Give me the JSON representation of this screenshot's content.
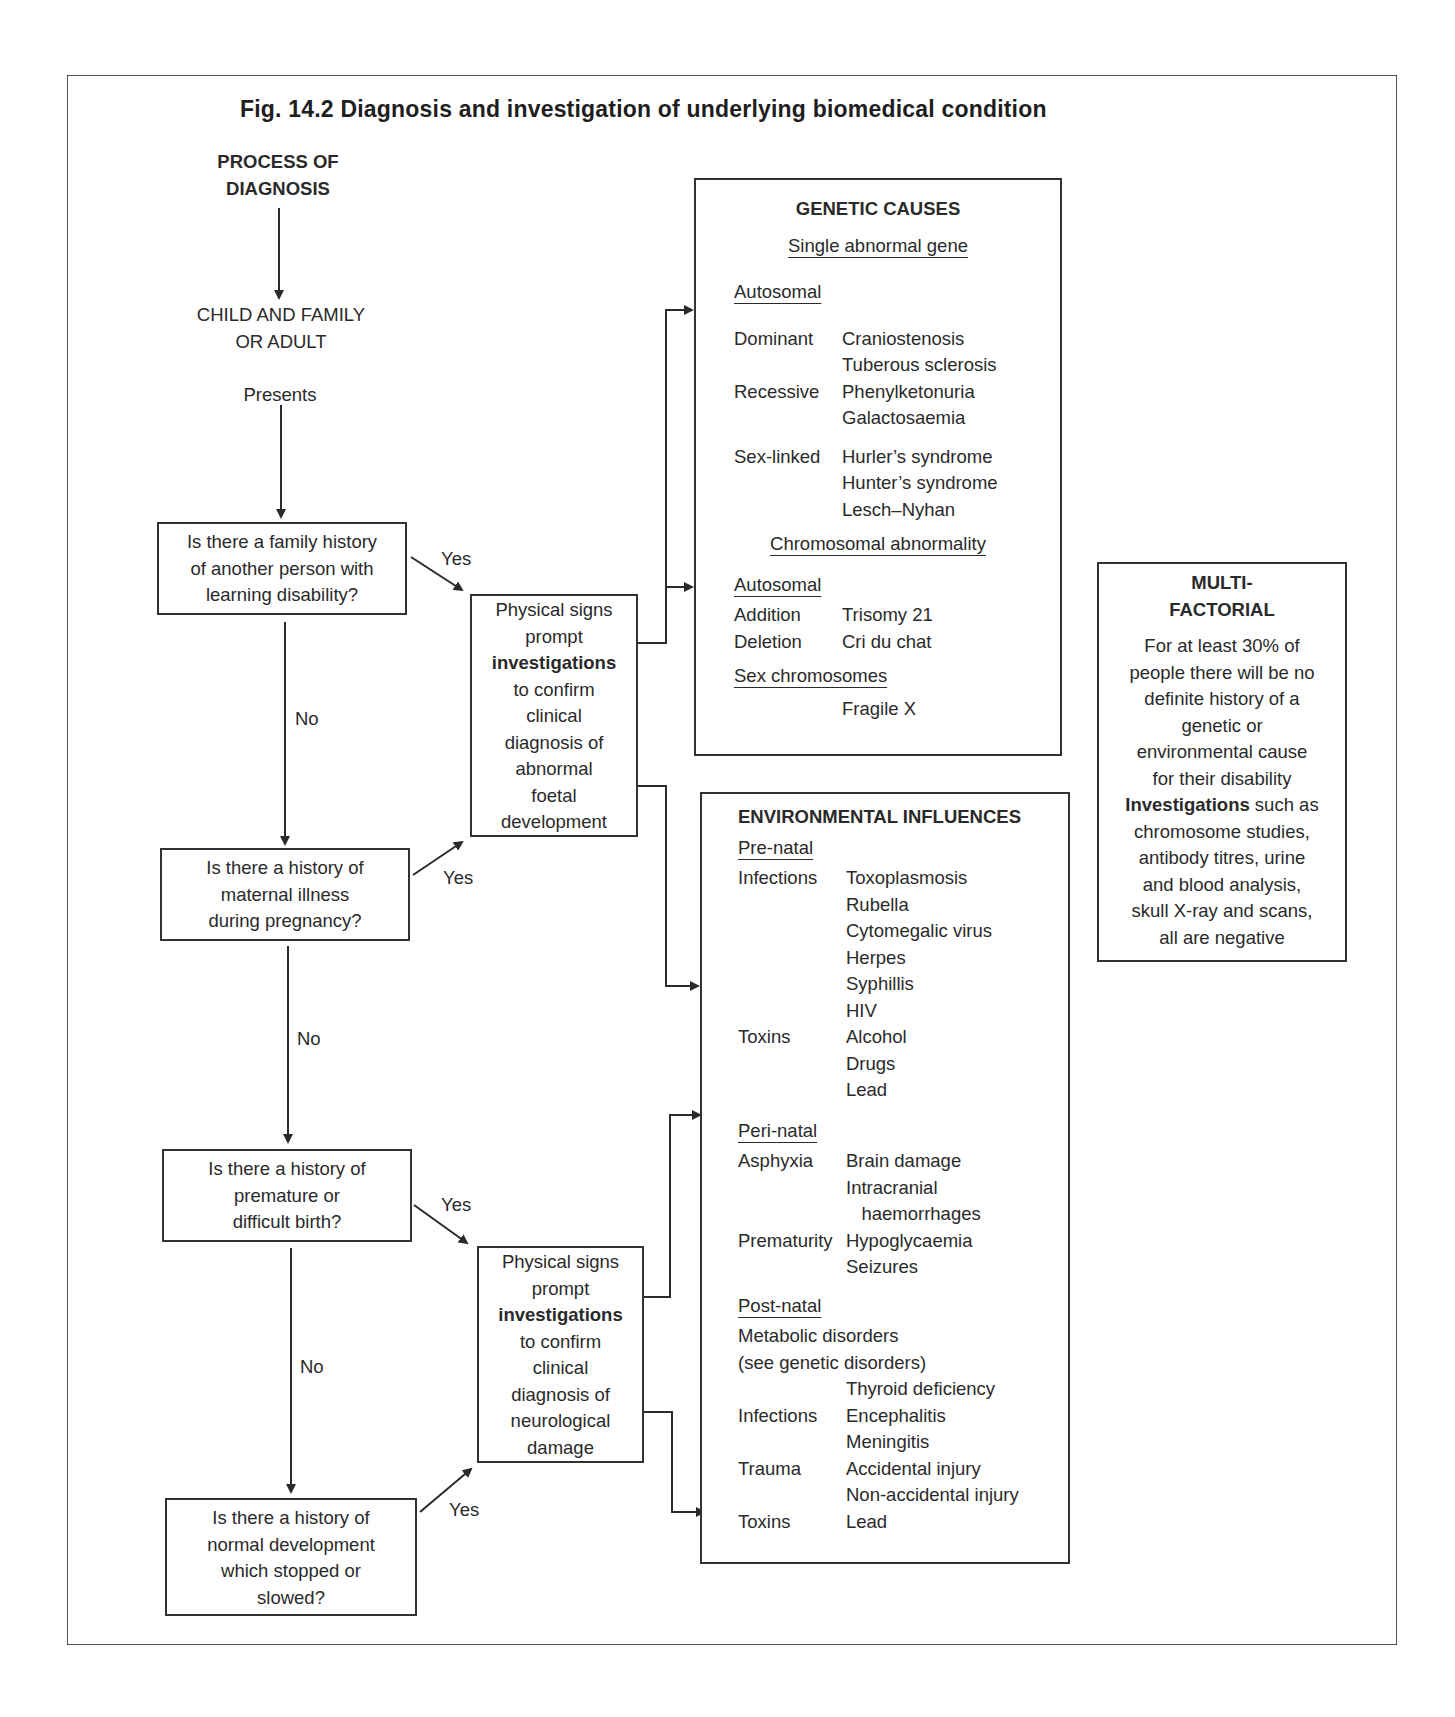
{
  "figure": {
    "title": "Fig. 14.2  Diagnosis and investigation of underlying biomedical condition"
  },
  "flow": {
    "start_label_line1": "PROCESS OF",
    "start_label_line2": "DIAGNOSIS",
    "presenter_line1": "CHILD AND FAMILY",
    "presenter_line2": "OR ADULT",
    "presents": "Presents",
    "questions": [
      {
        "lines": [
          "Is there a family history",
          "of another person with",
          "learning disability?"
        ],
        "yes": "Yes",
        "no": "No"
      },
      {
        "lines": [
          "Is there a history of",
          "maternal illness",
          "during pregnancy?"
        ],
        "yes": "Yes",
        "no": "No"
      },
      {
        "lines": [
          "Is there a history of",
          "premature or",
          "difficult birth?"
        ],
        "yes": "Yes",
        "no": "No"
      },
      {
        "lines": [
          "Is there a history of",
          "normal development",
          "which stopped or",
          "slowed?"
        ],
        "yes": "Yes"
      }
    ],
    "investigation_boxes": [
      {
        "lines": [
          "Physical signs",
          "prompt",
          "investigations",
          "to confirm",
          "clinical",
          "diagnosis of",
          "abnormal",
          "foetal",
          "development"
        ],
        "bold_line_index": 2
      },
      {
        "lines": [
          "Physical signs",
          "prompt",
          "investigations",
          "to confirm",
          "clinical",
          "diagnosis of",
          "neurological",
          "damage"
        ],
        "bold_line_index": 2
      }
    ]
  },
  "genetic": {
    "title": "GENETIC CAUSES",
    "single_gene_heading": "Single abnormal gene",
    "autosomal_heading": "Autosomal",
    "single_gene_rows": [
      {
        "k": "Dominant",
        "v": "Craniostenosis"
      },
      {
        "k": "",
        "v": "Tuberous sclerosis"
      },
      {
        "k": "Recessive",
        "v": "Phenylketonuria"
      },
      {
        "k": "",
        "v": "Galactosaemia"
      },
      {
        "k": "Sex-linked",
        "v": "Hurler’s syndrome"
      },
      {
        "k": "",
        "v": "Hunter’s syndrome"
      },
      {
        "k": "",
        "v": "Lesch–Nyhan"
      }
    ],
    "chromosomal_heading": "Chromosomal abnormality",
    "chrom_autosomal_heading": "Autosomal",
    "chromosomal_rows": [
      {
        "k": "Addition",
        "v": "Trisomy 21"
      },
      {
        "k": "Deletion",
        "v": "Cri du chat"
      }
    ],
    "sex_chrom_heading": "Sex chromosomes",
    "sex_chrom_item": "Fragile X"
  },
  "environmental": {
    "title": "ENVIRONMENTAL INFLUENCES",
    "prenatal_heading": "Pre-natal",
    "prenatal_rows": [
      {
        "k": "Infections",
        "v": "Toxoplasmosis"
      },
      {
        "k": "",
        "v": "Rubella"
      },
      {
        "k": "",
        "v": "Cytomegalic virus"
      },
      {
        "k": "",
        "v": "Herpes"
      },
      {
        "k": "",
        "v": "Syphillis"
      },
      {
        "k": "",
        "v": "HIV"
      },
      {
        "k": "Toxins",
        "v": "Alcohol"
      },
      {
        "k": "",
        "v": "Drugs"
      },
      {
        "k": "",
        "v": "Lead"
      }
    ],
    "perinatal_heading": "Peri-natal",
    "perinatal_rows": [
      {
        "k": "Asphyxia",
        "v": "Brain damage"
      },
      {
        "k": "",
        "v": "Intracranial"
      },
      {
        "k": "",
        "v": "   haemorrhages"
      },
      {
        "k": "Prematurity",
        "v": "Hypoglycaemia"
      },
      {
        "k": "",
        "v": "Seizures"
      }
    ],
    "postnatal_heading": "Post-natal",
    "postnatal_line1": "Metabolic disorders",
    "postnatal_line2": "(see genetic disorders)",
    "postnatal_rows": [
      {
        "k": "",
        "v": "Thyroid deficiency"
      },
      {
        "k": "Infections",
        "v": "Encephalitis"
      },
      {
        "k": "",
        "v": "Meningitis"
      },
      {
        "k": "Trauma",
        "v": "Accidental injury"
      },
      {
        "k": "",
        "v": "Non-accidental injury"
      },
      {
        "k": "Toxins",
        "v": "Lead"
      }
    ]
  },
  "multifactorial": {
    "title_line1": "MULTI-",
    "title_line2": "FACTORIAL",
    "body_lines": [
      "For at least 30% of",
      "people there will be no",
      "definite history of a",
      "genetic or",
      "environmental cause",
      "for their disability"
    ],
    "investigations_word": "Investigations",
    "investigations_rest": " such as",
    "body_lines2": [
      "chromosome studies,",
      "antibody titres, urine",
      "and blood analysis,",
      "skull X-ray and scans,",
      "all are negative"
    ]
  }
}
